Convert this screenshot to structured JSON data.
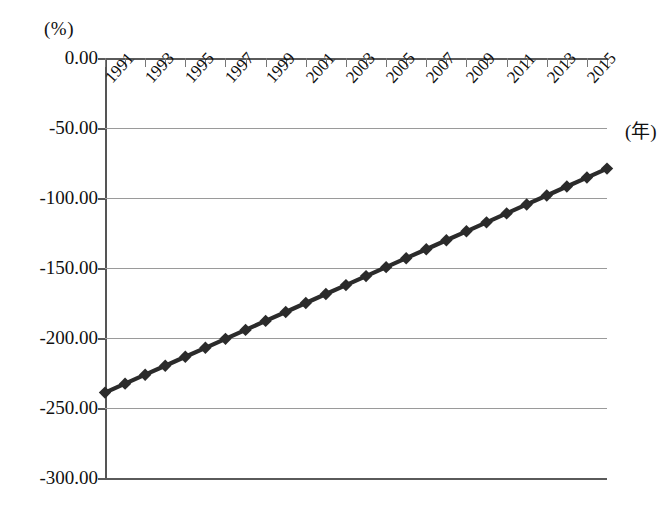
{
  "chart_data": {
    "type": "line",
    "title": "",
    "subtitle": "",
    "xlabel": "(年)",
    "ylabel": "(%)",
    "grid": true,
    "legend": false,
    "xlim": [
      1991,
      2016
    ],
    "ylim": [
      -300,
      0
    ],
    "y_ticks": [
      0,
      -50,
      -100,
      -150,
      -200,
      -250,
      -300
    ],
    "y_tick_labels": [
      "0.00",
      "-50.00",
      "-100.00",
      "-150.00",
      "-200.00",
      "-250.00",
      "-300.00"
    ],
    "x_ticks": [
      1991,
      1992,
      1993,
      1994,
      1995,
      1996,
      1997,
      1998,
      1999,
      2000,
      2001,
      2002,
      2003,
      2004,
      2005,
      2006,
      2007,
      2008,
      2009,
      2010,
      2011,
      2012,
      2013,
      2014,
      2015,
      2016
    ],
    "x_tick_labels_shown": [
      "1991",
      "1993",
      "1995",
      "1997",
      "1999",
      "2001",
      "2003",
      "2005",
      "2007",
      "2009",
      "2011",
      "2013",
      "2015"
    ],
    "x_tick_label_rotation_deg": -48,
    "marker": "diamond",
    "marker_color": "#2b2b2b",
    "line_color": "#2b2b2b",
    "series": [
      {
        "name": "",
        "x": [
          1991,
          1992,
          1993,
          1994,
          1995,
          1996,
          1997,
          1998,
          1999,
          2000,
          2001,
          2002,
          2003,
          2004,
          2005,
          2006,
          2007,
          2008,
          2009,
          2010,
          2011,
          2012,
          2013,
          2014,
          2015,
          2016
        ],
        "values": [
          -239.0,
          -232.6,
          -226.2,
          -219.8,
          -213.4,
          -207.0,
          -200.6,
          -194.2,
          -187.8,
          -181.4,
          -175.0,
          -168.6,
          -162.2,
          -155.8,
          -149.4,
          -143.0,
          -136.6,
          -130.2,
          -123.8,
          -117.4,
          -111.0,
          -104.6,
          -98.2,
          -91.8,
          -85.4,
          -79.0
        ]
      }
    ]
  }
}
